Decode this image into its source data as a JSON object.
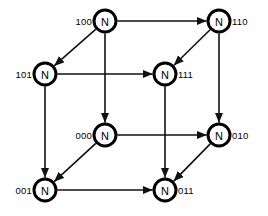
{
  "diagram": {
    "type": "hypercube-network-topology",
    "node_glyph": "N",
    "colors": {
      "background": "#ffffff",
      "node_fill": "#ffffff",
      "node_stroke": "#000000",
      "edge_stroke": "#111111",
      "label_text": "#000000"
    },
    "geometry": {
      "width": 268,
      "height": 216,
      "node_radius": 11,
      "node_stroke_width": 3,
      "edge_stroke_width": 1.6
    },
    "nodes": [
      {
        "id": "100",
        "label": "N",
        "address": "100",
        "x": 105,
        "y": 21,
        "label_side": "left"
      },
      {
        "id": "110",
        "label": "N",
        "address": "110",
        "x": 219,
        "y": 21,
        "label_side": "right"
      },
      {
        "id": "101",
        "label": "N",
        "address": "101",
        "x": 45,
        "y": 74,
        "label_side": "left"
      },
      {
        "id": "111",
        "label": "N",
        "address": "111",
        "x": 165,
        "y": 74,
        "label_side": "right"
      },
      {
        "id": "000",
        "label": "N",
        "address": "000",
        "x": 105,
        "y": 135,
        "label_side": "left"
      },
      {
        "id": "010",
        "label": "N",
        "address": "010",
        "x": 219,
        "y": 135,
        "label_side": "right"
      },
      {
        "id": "001",
        "label": "N",
        "address": "001",
        "x": 45,
        "y": 190,
        "label_side": "left"
      },
      {
        "id": "011",
        "label": "N",
        "address": "011",
        "x": 165,
        "y": 190,
        "label_side": "right"
      }
    ],
    "edges": [
      {
        "from": "100",
        "to": "110",
        "direction": "bidirectional",
        "kind": "horizontal"
      },
      {
        "from": "101",
        "to": "111",
        "direction": "bidirectional",
        "kind": "horizontal"
      },
      {
        "from": "000",
        "to": "010",
        "direction": "bidirectional",
        "kind": "horizontal"
      },
      {
        "from": "001",
        "to": "011",
        "direction": "bidirectional",
        "kind": "horizontal"
      },
      {
        "from": "100",
        "to": "000",
        "direction": "bidirectional",
        "kind": "vertical"
      },
      {
        "from": "110",
        "to": "010",
        "direction": "bidirectional",
        "kind": "vertical"
      },
      {
        "from": "101",
        "to": "001",
        "direction": "bidirectional",
        "kind": "vertical"
      },
      {
        "from": "111",
        "to": "011",
        "direction": "bidirectional",
        "kind": "vertical"
      },
      {
        "from": "100",
        "to": "101",
        "direction": "bidirectional",
        "kind": "diagonal"
      },
      {
        "from": "110",
        "to": "111",
        "direction": "bidirectional",
        "kind": "diagonal"
      },
      {
        "from": "000",
        "to": "001",
        "direction": "bidirectional",
        "kind": "diagonal"
      },
      {
        "from": "010",
        "to": "011",
        "direction": "bidirectional",
        "kind": "diagonal"
      }
    ]
  }
}
